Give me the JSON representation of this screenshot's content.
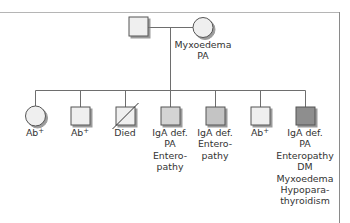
{
  "diagram": {
    "type": "pedigree",
    "colors": {
      "line": "#6e6e6e",
      "stroke": "#555555",
      "shadow": "#8c8c8c",
      "fill_unaffected": "#efefef",
      "fill_light": "#d4d4d4",
      "fill_medium": "#c4c4c4",
      "fill_dark": "#8e8e8e"
    },
    "parents": {
      "father": {
        "sex": "male",
        "fill": "#efefef",
        "label_lines": []
      },
      "mother": {
        "sex": "female",
        "fill": "#efefef",
        "label_lines": [
          "Myxoedema",
          "PA"
        ]
      }
    },
    "children": [
      {
        "sex": "female",
        "fill": "#efefef",
        "deceased": false,
        "label": "Ab",
        "label_sup": "+",
        "label_lines": []
      },
      {
        "sex": "male",
        "fill": "#efefef",
        "deceased": false,
        "label": "Ab",
        "label_sup": "+",
        "label_lines": []
      },
      {
        "sex": "male",
        "fill": "#efefef",
        "deceased": true,
        "label": "Died",
        "label_sup": "",
        "label_lines": []
      },
      {
        "sex": "male",
        "fill": "#d4d4d4",
        "deceased": false,
        "label": "IgA def.",
        "label_sup": "",
        "label_lines": [
          "PA",
          "Entero-",
          "pathy"
        ]
      },
      {
        "sex": "male",
        "fill": "#c4c4c4",
        "deceased": false,
        "label": "IgA def.",
        "label_sup": "",
        "label_lines": [
          "Entero-",
          "pathy"
        ]
      },
      {
        "sex": "male",
        "fill": "#efefef",
        "deceased": false,
        "label": "Ab",
        "label_sup": "+",
        "label_lines": []
      },
      {
        "sex": "male",
        "fill": "#8e8e8e",
        "deceased": false,
        "label": "IgA def.",
        "label_sup": "",
        "label_lines": [
          "PA",
          "Enteropathy",
          "DM",
          "Myxoedema",
          "Hypopara-",
          "thyroidism"
        ]
      }
    ]
  }
}
